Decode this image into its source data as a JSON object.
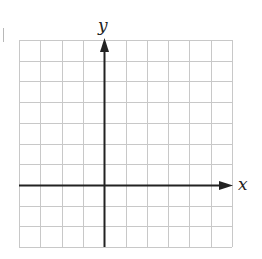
{
  "figure": {
    "type": "coordinate-grid",
    "x_axis_label": "x",
    "y_axis_label": "y",
    "grid": {
      "columns": 10,
      "rows": 10,
      "columns_left_of_y_axis": 4,
      "columns_right_of_y_axis": 6,
      "rows_above_x_axis": 7,
      "rows_below_x_axis": 3
    },
    "colors": {
      "grid_line": "#c8c8c8",
      "axis_line": "#222222",
      "background": "#ffffff"
    },
    "arrows": {
      "x_axis": "positive-direction-only",
      "y_axis": "positive-direction-only"
    }
  }
}
